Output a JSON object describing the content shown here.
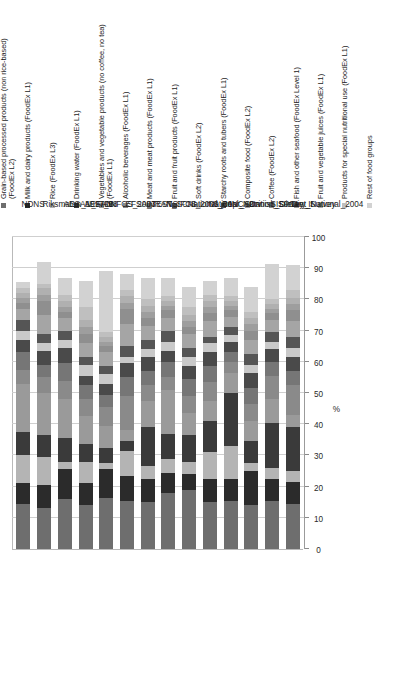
{
  "figure": {
    "orientation": "rotated-90-ccw",
    "axis_title": "%",
    "background": "#ffffff"
  },
  "legend": {
    "items": [
      {
        "label": "Grain-based processed products (non rice-based)\n(FoodEx L2)",
        "color": "#6e6e6e"
      },
      {
        "label": "Milk and  dairy products (FoodEx L1)",
        "color": "#2b2b2b"
      },
      {
        "label": "Rice (FoodEx L3)",
        "color": "#b4b4b4"
      },
      {
        "label": "Drinking water (FoodEx L1)",
        "color": "#3a3a3a"
      },
      {
        "label": "Vegetables and vegetable products (no coffee, no tea)\n(FoodEx L1)",
        "color": "#9a9a9a"
      },
      {
        "label": "Alcoholic beverages  (FoodEx L1)",
        "color": "#8a8a8a"
      },
      {
        "label": "Meat and meat products (FoodEx L1)",
        "color": "#767676"
      },
      {
        "label": "Fruit and fruit products (FoodEx L1)",
        "color": "#4a4a4a"
      },
      {
        "label": "Soft drinks (FoodEx L2)",
        "color": "#c9c9c9"
      },
      {
        "label": "Starchy roots and tubers (FoodEx L1)",
        "color": "#555555"
      },
      {
        "label": "Composite food (FoodEx L2)",
        "color": "#a5a5a5"
      },
      {
        "label": "Coffee (FoodEx L2)",
        "color": "#8f8f8f"
      },
      {
        "label": "Fish and other seafood (FoodEx Level 1)",
        "color": "#9e9e9e"
      },
      {
        "label": "Fruit and vegetable juices (FoodEx L1)",
        "color": "#b0b0b0"
      },
      {
        "label": "Products for special nutritional use  (FoodEx L1)",
        "color": "#bfbfbf"
      },
      {
        "label": "Rest of food groups",
        "color": "#d2d2d2"
      }
    ]
  },
  "chart_data": {
    "type": "bar",
    "subtype": "stacked-horizontal-rotated",
    "title": "",
    "xlabel": "",
    "ylabel": "%",
    "ylim": [
      0,
      100
    ],
    "grid": true,
    "legend_position": "top",
    "tick_labels": [
      "0",
      "10",
      "20",
      "30",
      "40",
      "50",
      "60",
      "70",
      "80",
      "90",
      "100"
    ],
    "tick_values": [
      0,
      10,
      20,
      30,
      40,
      50,
      60,
      70,
      80,
      90,
      100
    ],
    "categories": [
      "NDNS",
      "Riksmaten_1997_98",
      "AESAN_FIAB",
      "AESAN",
      "DNFCS_2003",
      "EFSA_TEST",
      "INRAN_SCAI_2005_06",
      "NSIFCS",
      "National_Repr_Surv",
      "National_Nutrition_Survey_II",
      "INCA2",
      "Danish_Dietary_Survey",
      "SISP04",
      "Diet_National_2004"
    ],
    "series": [
      {
        "name": "Grain-based processed products (non rice-based) (FoodEx L2)",
        "color": "#6e6e6e",
        "values": [
          14.5,
          13.0,
          16.0,
          14.0,
          16.5,
          15.5,
          15.0,
          18.0,
          19.0,
          15.0,
          15.5,
          14.0,
          15.5,
          14.5
        ]
      },
      {
        "name": "Milk and  dairy products (FoodEx L1)",
        "color": "#2b2b2b",
        "values": [
          6.5,
          7.5,
          9.5,
          7.0,
          9.0,
          8.0,
          7.5,
          6.5,
          5.0,
          7.5,
          7.0,
          11.0,
          7.0,
          7.0
        ]
      },
      {
        "name": "Rice (FoodEx L3)",
        "color": "#b4b4b4",
        "values": [
          9.0,
          9.0,
          2.5,
          7.0,
          2.0,
          8.0,
          4.0,
          4.5,
          4.0,
          8.5,
          10.5,
          2.5,
          3.5,
          3.5
        ]
      },
      {
        "name": "Drinking water (FoodEx L1)",
        "color": "#3a3a3a",
        "values": [
          7.5,
          7.0,
          7.5,
          5.5,
          5.0,
          3.0,
          12.5,
          8.0,
          8.5,
          10.0,
          17.0,
          7.0,
          14.5,
          14.0
        ]
      },
      {
        "name": "Vegetables and vegetable products (no coffee, no tea) (FoodEx L1)",
        "color": "#9a9a9a",
        "values": [
          15.5,
          13.5,
          12.5,
          9.0,
          7.0,
          3.5,
          8.5,
          14.0,
          7.0,
          6.5,
          6.5,
          6.5,
          7.5,
          4.0
        ]
      },
      {
        "name": "Alcoholic beverages  (FoodEx L1)",
        "color": "#8a8a8a",
        "values": [
          4.5,
          5.0,
          6.0,
          5.5,
          6.0,
          11.0,
          5.0,
          4.0,
          5.5,
          6.0,
          3.5,
          5.5,
          7.5,
          9.5
        ]
      },
      {
        "name": "Meat and meat products (FoodEx L1)",
        "color": "#767676",
        "values": [
          5.5,
          4.0,
          5.5,
          4.5,
          4.0,
          6.0,
          4.5,
          5.0,
          5.5,
          5.0,
          3.0,
          5.0,
          4.5,
          4.5
        ]
      },
      {
        "name": "Fruit and fruit products (FoodEx L1)",
        "color": "#4a4a4a",
        "values": [
          4.0,
          4.5,
          5.0,
          3.0,
          3.5,
          4.5,
          4.5,
          3.5,
          4.0,
          4.5,
          3.5,
          5.0,
          4.0,
          4.5
        ]
      },
      {
        "name": "Soft drinks (FoodEx L2)",
        "color": "#c9c9c9",
        "values": [
          3.0,
          2.5,
          2.5,
          3.5,
          3.0,
          2.0,
          2.5,
          3.0,
          3.0,
          3.0,
          2.0,
          2.5,
          2.5,
          3.0
        ]
      },
      {
        "name": "Starchy roots and tubers (FoodEx L1)",
        "color": "#555555",
        "values": [
          3.5,
          3.0,
          3.0,
          2.5,
          2.5,
          3.5,
          3.0,
          3.5,
          3.0,
          2.0,
          2.5,
          3.5,
          3.0,
          3.5
        ]
      },
      {
        "name": "Composite food (FoodEx L2)",
        "color": "#a5a5a5",
        "values": [
          3.5,
          6.0,
          4.0,
          4.5,
          4.5,
          7.0,
          4.5,
          4.0,
          4.5,
          5.0,
          3.5,
          4.5,
          4.0,
          5.0
        ]
      },
      {
        "name": "Coffee (FoodEx L2)",
        "color": "#8f8f8f",
        "values": [
          2.0,
          4.5,
          2.0,
          3.0,
          2.0,
          5.0,
          2.5,
          2.5,
          2.0,
          2.5,
          2.0,
          3.0,
          2.0,
          3.5
        ]
      },
      {
        "name": "Fish and other seafood (FoodEx Level 1)",
        "color": "#9e9e9e",
        "values": [
          1.5,
          2.0,
          1.5,
          2.0,
          1.5,
          2.0,
          2.0,
          1.5,
          2.0,
          2.0,
          1.5,
          2.0,
          1.5,
          2.0
        ]
      },
      {
        "name": "Fruit and vegetable juices (FoodEx L1)",
        "color": "#b0b0b0",
        "values": [
          1.5,
          2.0,
          2.0,
          2.5,
          1.5,
          2.0,
          2.0,
          1.5,
          2.0,
          2.0,
          1.5,
          2.0,
          1.5,
          2.0
        ]
      },
      {
        "name": "Products for special nutritional use  (FoodEx L1)",
        "color": "#bfbfbf",
        "values": [
          1.5,
          1.5,
          2.0,
          4.0,
          1.5,
          2.0,
          2.0,
          1.5,
          2.5,
          2.0,
          1.5,
          2.0,
          1.5,
          2.5
        ]
      },
      {
        "name": "Rest of food groups",
        "color": "#d2d2d2",
        "values": [
          2.0,
          7.0,
          5.5,
          8.5,
          19.5,
          5.0,
          7.0,
          6.0,
          6.5,
          4.5,
          6.0,
          8.0,
          11.5,
          8.0
        ]
      }
    ]
  }
}
